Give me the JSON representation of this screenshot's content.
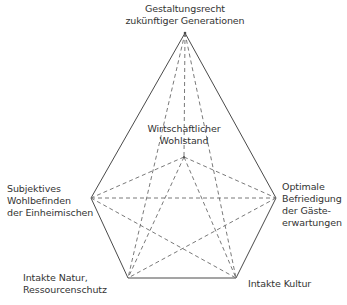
{
  "diagram": {
    "type": "pentagon-star",
    "nodes": {
      "top": {
        "lines": [
          "Gestaltungsrecht",
          "zukünftiger Generationen"
        ],
        "x": 185,
        "y": 33
      },
      "center": {
        "lines": [
          "Wirtschaftlicher",
          "Wohlstand"
        ],
        "x": 184,
        "y": 157
      },
      "left": {
        "lines": [
          "Subjektives",
          "Wohlbefinden",
          "der Einheimischen"
        ],
        "x": 91,
        "y": 198
      },
      "right": {
        "lines": [
          "Optimale",
          "Befriedigung",
          "der Gäste-",
          "erwartungen"
        ],
        "x": 276,
        "y": 198
      },
      "bottom_left": {
        "lines": [
          "Intakte Natur,",
          "Ressourcenschutz"
        ],
        "x": 128,
        "y": 278
      },
      "bottom_right": {
        "lines": [
          "Intakte Kultur"
        ],
        "x": 236,
        "y": 278
      }
    },
    "outline": [
      "top",
      "right",
      "bottom_right",
      "bottom_left",
      "left"
    ],
    "dashed_edges": [
      [
        "top",
        "center"
      ],
      [
        "top",
        "bottom_left"
      ],
      [
        "top",
        "bottom_right"
      ],
      [
        "center",
        "left"
      ],
      [
        "center",
        "right"
      ],
      [
        "center",
        "bottom_left"
      ],
      [
        "center",
        "bottom_right"
      ],
      [
        "left",
        "right"
      ],
      [
        "left",
        "bottom_right"
      ],
      [
        "right",
        "bottom_left"
      ],
      [
        "left",
        "bottom_left"
      ],
      [
        "right",
        "bottom_right"
      ]
    ],
    "colors": {
      "solid_line": "#4a4a4a",
      "dashed_line": "#6a6a6a",
      "text": "#333333"
    }
  }
}
